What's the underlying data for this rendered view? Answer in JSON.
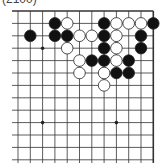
{
  "caption": "(2100)",
  "board": {
    "columns": 12,
    "rows": 13,
    "origin_x": 18,
    "origin_y": 11,
    "spacing_x": 12.3,
    "spacing_y": 12.4,
    "right_edge": true,
    "top_edge": true,
    "star_points": [
      [
        2,
        3
      ],
      [
        2,
        9
      ],
      [
        8,
        9
      ]
    ],
    "stones": [
      {
        "color": "black",
        "col": 3,
        "row": 1
      },
      {
        "color": "white",
        "col": 4,
        "row": 1
      },
      {
        "color": "black",
        "col": 7,
        "row": 1
      },
      {
        "color": "white",
        "col": 8,
        "row": 1
      },
      {
        "color": "white",
        "col": 9,
        "row": 1
      },
      {
        "color": "white",
        "col": 10,
        "row": 1
      },
      {
        "color": "black",
        "col": 11,
        "row": 1
      },
      {
        "color": "black",
        "col": 1,
        "row": 2
      },
      {
        "color": "black",
        "col": 3,
        "row": 2
      },
      {
        "color": "black",
        "col": 4,
        "row": 2
      },
      {
        "color": "white",
        "col": 5,
        "row": 2
      },
      {
        "color": "white",
        "col": 6,
        "row": 2
      },
      {
        "color": "black",
        "col": 7,
        "row": 2
      },
      {
        "color": "white",
        "col": 8,
        "row": 2
      },
      {
        "color": "black",
        "col": 10,
        "row": 2
      },
      {
        "color": "white",
        "col": 4,
        "row": 3
      },
      {
        "color": "black",
        "col": 7,
        "row": 3
      },
      {
        "color": "white",
        "col": 8,
        "row": 3
      },
      {
        "color": "black",
        "col": 10,
        "row": 3
      },
      {
        "color": "white",
        "col": 5,
        "row": 4
      },
      {
        "color": "black",
        "col": 6,
        "row": 4
      },
      {
        "color": "black",
        "col": 7,
        "row": 4
      },
      {
        "color": "white",
        "col": 8,
        "row": 4
      },
      {
        "color": "black",
        "col": 9,
        "row": 4
      },
      {
        "color": "white",
        "col": 5,
        "row": 5
      },
      {
        "color": "white",
        "col": 7,
        "row": 5
      },
      {
        "color": "black",
        "col": 8,
        "row": 5
      },
      {
        "color": "black",
        "col": 9,
        "row": 5
      },
      {
        "color": "white",
        "col": 7,
        "row": 6
      }
    ]
  }
}
